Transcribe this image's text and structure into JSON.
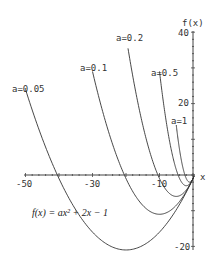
{
  "chart_data": {
    "type": "line",
    "title": "",
    "formula": "f(x) = ax² + 2x − 1",
    "xlabel": "x",
    "ylabel": "f(x)",
    "xlim": [
      -50,
      0
    ],
    "ylim": [
      -20,
      40
    ],
    "x_ticks": [
      -50,
      -30,
      -10
    ],
    "y_ticks": [
      40,
      20,
      -20
    ],
    "grid": false,
    "series": [
      {
        "name": "a=0.05",
        "a": 0.05,
        "x": [
          -50,
          -40,
          -30,
          -20,
          -10,
          0
        ],
        "values": [
          24,
          -1,
          -16,
          -21,
          -16,
          -1
        ],
        "vertex": [
          -20,
          -21
        ]
      },
      {
        "name": "a=0.1",
        "a": 0.1,
        "x": [
          -30,
          -20,
          -10,
          0
        ],
        "values": [
          29,
          -1,
          -11,
          -1
        ],
        "vertex": [
          -10,
          -11
        ]
      },
      {
        "name": "a=0.2",
        "a": 0.2,
        "x": [
          -19.4,
          -10,
          -5,
          0
        ],
        "values": [
          35.4,
          -1,
          -6,
          -1
        ],
        "vertex": [
          -5,
          -6
        ]
      },
      {
        "name": "a=0.5",
        "a": 0.5,
        "x": [
          -10,
          -4,
          -2,
          0
        ],
        "values": [
          29,
          -1,
          -3,
          -1
        ],
        "vertex": [
          -2,
          -3
        ]
      },
      {
        "name": "a=1",
        "a": 1,
        "x": [
          -5,
          -2,
          -1,
          0
        ],
        "values": [
          14,
          -1,
          -2,
          -1
        ],
        "vertex": [
          -1,
          -2
        ]
      }
    ],
    "labels": {
      "y_axis": "f(x)",
      "x_axis": "x",
      "y40": "40",
      "y20": "20",
      "yneg20": "-20",
      "xneg50": "-50",
      "xneg30": "-30",
      "xneg10": "-10",
      "s005": "a=0.05",
      "s01": "a=0.1",
      "s02": "a=0.2",
      "s05": "a=0.5",
      "s1": "a=1"
    }
  }
}
